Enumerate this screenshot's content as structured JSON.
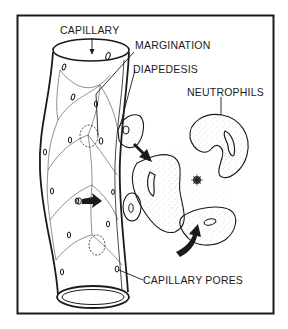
{
  "diagram": {
    "type": "illustration",
    "labels": {
      "capillary": "CAPILLARY",
      "margination": "MARGINATION",
      "diapedesis": "DIAPEDESIS",
      "neutrophils": "NEUTROPHILS",
      "capillary_pores": "CAPILLARY PORES"
    },
    "colors": {
      "ink": "#1a1a1a",
      "background": "#ffffff"
    }
  }
}
